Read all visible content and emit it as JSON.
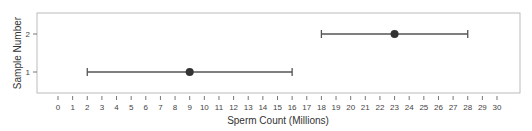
{
  "chart_data": {
    "type": "errorbar",
    "title": "",
    "xlabel": "Sperm Count (Millions)",
    "ylabel": "Sample Number",
    "xlim": [
      0,
      30
    ],
    "ylim": [
      0.5,
      2.5
    ],
    "x_ticks": [
      0,
      1,
      2,
      3,
      4,
      5,
      6,
      7,
      8,
      9,
      10,
      11,
      12,
      13,
      14,
      15,
      16,
      17,
      18,
      19,
      20,
      21,
      22,
      23,
      24,
      25,
      26,
      27,
      28,
      29,
      30
    ],
    "y_ticks": [
      1,
      2
    ],
    "grid": false,
    "legend": null,
    "series": [
      {
        "name": "Sample 1",
        "y": 1,
        "point": 9,
        "lower": 2,
        "upper": 16
      },
      {
        "name": "Sample 2",
        "y": 2,
        "point": 23,
        "lower": 18,
        "upper": 28
      }
    ],
    "colors": {
      "line": "#555555",
      "point": "#333333",
      "frame": "#bbbbbb",
      "tick": "#777777"
    }
  }
}
